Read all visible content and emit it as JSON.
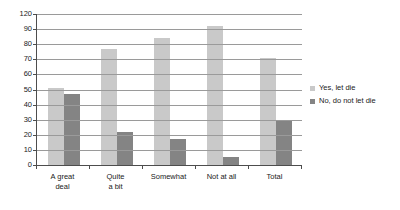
{
  "chart_data": {
    "type": "bar",
    "title": "",
    "subtitle": "",
    "xlabel": "",
    "ylabel": "",
    "categories": [
      "A great\ndeal",
      "Quite\na bit",
      "Somewhat",
      "Not at all",
      "Total"
    ],
    "series": [
      {
        "name": "Yes, let die",
        "color": "#c9c9c9",
        "values": [
          51,
          77,
          84,
          96,
          71
        ]
      },
      {
        "name": "No, do not let die",
        "color": "#848484",
        "values": [
          47,
          22,
          17,
          5,
          29
        ]
      }
    ],
    "y_ticks": [
      120,
      90,
      80,
      70,
      60,
      50,
      40,
      30,
      20,
      10,
      0
    ],
    "ylim": [
      0,
      120
    ],
    "grid": true,
    "legend_position": "right",
    "axis_color": "#4d4d4d",
    "grid_color": "#9a9a9a",
    "background": "#ffffff"
  }
}
